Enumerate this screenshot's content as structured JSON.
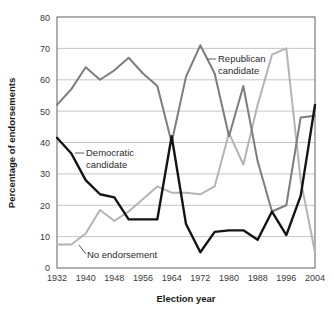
{
  "chart_data": {
    "type": "line",
    "title": "",
    "subtitle": "",
    "xlabel": "Election year",
    "ylabel": "Percentage of endorsements",
    "xlim": [
      1932,
      2004
    ],
    "ylim": [
      0,
      80
    ],
    "grid": true,
    "legend_position": "inline-annotations",
    "x": [
      1932,
      1936,
      1940,
      1944,
      1948,
      1952,
      1956,
      1960,
      1964,
      1968,
      1972,
      1976,
      1980,
      1984,
      1988,
      1992,
      1996,
      2000,
      2004
    ],
    "xtick_labels": [
      "1932",
      "1940",
      "1948",
      "1956",
      "1964",
      "1972",
      "1980",
      "1988",
      "1996",
      "2004"
    ],
    "xtick_values": [
      1932,
      1940,
      1948,
      1956,
      1964,
      1972,
      1980,
      1988,
      1996,
      2004
    ],
    "ytick_labels": [
      "0",
      "10",
      "20",
      "30",
      "40",
      "50",
      "60",
      "70",
      "80"
    ],
    "ytick_values": [
      0,
      10,
      20,
      30,
      40,
      50,
      60,
      70,
      80
    ],
    "series": [
      {
        "name": "Republican candidate",
        "color": "#7d7d7d",
        "width": 2.0,
        "values": [
          52,
          57,
          64,
          60,
          63,
          67,
          62,
          58,
          40,
          61,
          71,
          62,
          42,
          58,
          34,
          18,
          20,
          48,
          48.5
        ]
      },
      {
        "name": "Democratic candidate",
        "color": "#141414",
        "width": 2.4,
        "values": [
          41.5,
          36.5,
          28,
          23.5,
          22.5,
          15.5,
          15.5,
          15.5,
          42,
          14,
          5,
          11.5,
          12,
          12,
          9,
          18,
          10.5,
          23,
          52
        ]
      },
      {
        "name": "No endorsement",
        "color": "#b4b4b4",
        "width": 2.0,
        "values": [
          7.5,
          7.5,
          11,
          18.5,
          15,
          18,
          22,
          26,
          24,
          24,
          23.5,
          26,
          43,
          33,
          52,
          68,
          70,
          28,
          5
        ]
      }
    ],
    "annotations": [
      {
        "text_line1": "Republican",
        "text_line2": "candidate"
      },
      {
        "text_line1": "Democratic",
        "text_line2": "candidate"
      },
      {
        "text_line1": "No endorsement",
        "text_line2": ""
      }
    ]
  },
  "axes": {
    "y_title": "Percentage of endorsements",
    "x_title": "Election year"
  },
  "labels": {
    "republican_l1": "Republican",
    "republican_l2": "candidate",
    "democratic_l1": "Democratic",
    "democratic_l2": "candidate",
    "no_endorsement": "No endorsement"
  },
  "ytick": {
    "t0": "0",
    "t10": "10",
    "t20": "20",
    "t30": "30",
    "t40": "40",
    "t50": "50",
    "t60": "60",
    "t70": "70",
    "t80": "80"
  },
  "xtick": {
    "t1932": "1932",
    "t1940": "1940",
    "t1948": "1948",
    "t1956": "1956",
    "t1964": "1964",
    "t1972": "1972",
    "t1980": "1980",
    "t1988": "1988",
    "t1996": "1996",
    "t2004": "2004"
  },
  "colors": {
    "republican": "#7d7d7d",
    "democratic": "#141414",
    "no_endorsement": "#b4b4b4",
    "grid": "#b8b8b8",
    "frame": "#6e6e6e"
  }
}
